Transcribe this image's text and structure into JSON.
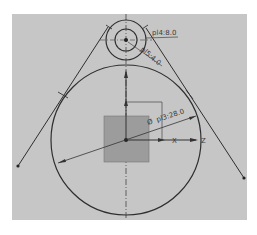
{
  "viewport": {
    "background": "#c6c6c6",
    "page_background": "#ffffff",
    "line_color": "#2e2e2e",
    "square_fill": "#9c9c9c"
  },
  "sketch": {
    "small_pulley": {
      "cx": 126,
      "cy": 40,
      "outer_r": 20,
      "inner_r": 11
    },
    "large_pulley": {
      "cx": 126,
      "cy": 140,
      "r": 75
    },
    "belt_left": {
      "x1": 18,
      "y1": 166,
      "x2": 108,
      "y2": 27
    },
    "belt_right": {
      "x1": 244,
      "y1": 178,
      "x2": 146,
      "y2": 28
    },
    "origin_square": {
      "x": 104,
      "y": 116,
      "w": 45,
      "h": 46
    }
  },
  "dimensions": {
    "small_outer": {
      "label": "pl4:8.0"
    },
    "small_inner": {
      "label": "pl5:4.0"
    },
    "large_diameter": {
      "symbol": "Ø",
      "label": "pl3:28.0"
    }
  },
  "axes": {
    "horizontal_label": "X",
    "horizontal_end_label": "Z",
    "vertical_label": "Y"
  }
}
